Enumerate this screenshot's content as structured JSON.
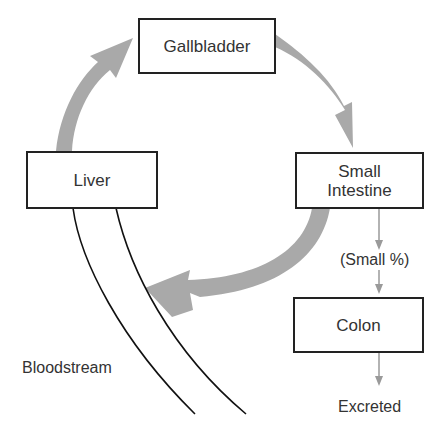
{
  "colors": {
    "cycle_arrow": "#a9a9a9",
    "thin_arrow": "#9a9a9a",
    "box_border": "#222222",
    "text": "#333333",
    "bloodstream_line": "#111111"
  },
  "nodes": {
    "gallbladder": {
      "label": "Gallbladder"
    },
    "liver": {
      "label": "Liver"
    },
    "small_intestine": {
      "line1": "Small",
      "line2": "Intestine"
    },
    "colon": {
      "label": "Colon"
    }
  },
  "labels": {
    "small_percent": "(Small %)",
    "excreted": "Excreted",
    "bloodstream": "Bloodstream"
  },
  "edges": [
    {
      "from": "Liver",
      "to": "Gallbladder",
      "style": "thick-gray-curved-arrow"
    },
    {
      "from": "Gallbladder",
      "to": "Small Intestine",
      "style": "thick-gray-curved-arrow"
    },
    {
      "from": "Small Intestine",
      "to": "Liver",
      "style": "thick-gray-curved-arrow",
      "via": "Bloodstream"
    },
    {
      "from": "Small Intestine",
      "to": "Colon",
      "style": "thin-gray-arrow",
      "label": "(Small %)"
    },
    {
      "from": "Colon",
      "to": "Excreted",
      "style": "thin-gray-arrow"
    }
  ]
}
